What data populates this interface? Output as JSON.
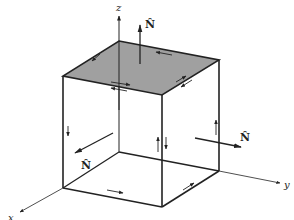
{
  "figure": {
    "colors": {
      "edge": "#222222",
      "top_face_fill": "#a0a0a0",
      "background": "#ffffff"
    },
    "axes": {
      "x_label": "x",
      "y_label": "y",
      "z_label": "z"
    },
    "normals": {
      "top_label": "N̂",
      "front_label": "N̂",
      "right_label": "N̂"
    }
  }
}
